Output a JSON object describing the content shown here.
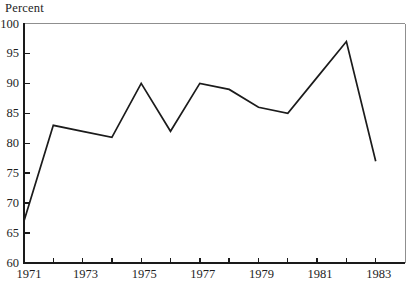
{
  "chart_data": {
    "type": "line",
    "title": "Percent",
    "xlabel": "",
    "ylabel": "Percent",
    "x": [
      1971,
      1972,
      1973,
      1974,
      1975,
      1976,
      1977,
      1978,
      1979,
      1980,
      1981,
      1982,
      1983
    ],
    "values": [
      67,
      83,
      82,
      81,
      90,
      82,
      90,
      89,
      86,
      85,
      91,
      97,
      77
    ],
    "xlim": [
      1971,
      1984
    ],
    "ylim": [
      60,
      100
    ],
    "y_tick_labels": [
      "60",
      "65",
      "70",
      "75",
      "80",
      "85",
      "90",
      "95",
      "100"
    ],
    "x_tick_labels": [
      "1971",
      "1973",
      "1975",
      "1977",
      "1979",
      "1981",
      "1983"
    ],
    "x_minor_ticks": [
      1972,
      1973,
      1974,
      1975,
      1976,
      1977,
      1978,
      1979,
      1980,
      1981,
      1982,
      1983
    ],
    "grid": "off",
    "legend": "none",
    "line_color": "#1b1b1b",
    "axis_color": "#1a1a1a",
    "box_border_color": "#8f8f8f",
    "background_color": "#ffffff"
  }
}
